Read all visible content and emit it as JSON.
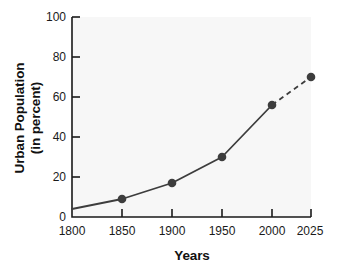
{
  "chart_data": {
    "type": "line",
    "title": "",
    "xlabel": "Years",
    "ylabel": "Urban Population (in percent)",
    "ylabel_line1": "Urban Population",
    "ylabel_line2": "(in percent)",
    "x": [
      1800,
      1850,
      1900,
      1950,
      2000,
      2025
    ],
    "values": [
      4,
      9,
      17,
      30,
      56,
      70
    ],
    "xticks": [
      "1800",
      "1850",
      "1900",
      "1950",
      "2000",
      "2025"
    ],
    "yticks": [
      "100",
      "80",
      "60",
      "40",
      "20",
      "0"
    ],
    "ylim": [
      0,
      100
    ],
    "xlim": [
      1800,
      2025
    ],
    "grid": false,
    "legend": "none",
    "series": [
      {
        "name": "Urban Population",
        "points": [
          {
            "x": 1800,
            "y": 4,
            "marker": false,
            "segment": "solid"
          },
          {
            "x": 1850,
            "y": 9,
            "marker": true,
            "segment": "solid"
          },
          {
            "x": 1900,
            "y": 17,
            "marker": true,
            "segment": "solid"
          },
          {
            "x": 1950,
            "y": 30,
            "marker": true,
            "segment": "solid"
          },
          {
            "x": 2000,
            "y": 56,
            "marker": true,
            "segment": "dashed"
          },
          {
            "x": 2025,
            "y": 70,
            "marker": true,
            "segment": "none"
          }
        ]
      }
    ],
    "annotations": [
      "Segment from 2000 to 2025 is drawn dashed, indicating a projection."
    ],
    "colors": {
      "line": "#3d3d3d",
      "marker": "#3d3d3d",
      "axis": "#1a1a1a",
      "plot_background": "#f7f7f7",
      "figure_background": "#ffffff",
      "text": "#111111"
    }
  }
}
